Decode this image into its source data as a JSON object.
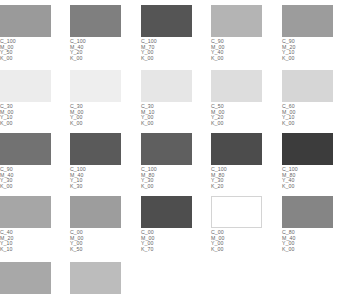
{
  "swatches": [
    {
      "color": "#9a9a9a",
      "label": [
        "C_100",
        "M_00",
        "Y_50",
        "K_00"
      ]
    },
    {
      "color": "#7f7f7f",
      "label": [
        "C_100",
        "M_40",
        "Y_20",
        "K_00"
      ]
    },
    {
      "color": "#555555",
      "label": [
        "C_100",
        "M_70",
        "Y_00",
        "K_00"
      ]
    },
    {
      "color": "#b4b4b4",
      "label": [
        "C_90",
        "M_00",
        "Y_40",
        "K_00"
      ]
    },
    {
      "color": "#9c9c9c",
      "label": [
        "C_90",
        "M_20",
        "Y_10",
        "K_00"
      ]
    },
    {
      "color": "#ececec",
      "label": [
        "C_30",
        "M_00",
        "Y_10",
        "K_00"
      ]
    },
    {
      "color": "#eeeeee",
      "label": [
        "C_30",
        "M_00",
        "Y_00",
        "K_00"
      ]
    },
    {
      "color": "#e6e6e6",
      "label": [
        "C_30",
        "M_10",
        "Y_00",
        "K_00"
      ]
    },
    {
      "color": "#dddddd",
      "label": [
        "C_50",
        "M_00",
        "Y_20",
        "K_00"
      ]
    },
    {
      "color": "#d6d6d6",
      "label": [
        "C_60",
        "M_00",
        "Y_10",
        "K_00"
      ]
    },
    {
      "color": "#727272",
      "label": [
        "C_90",
        "M_40",
        "Y_30",
        "K_00"
      ]
    },
    {
      "color": "#5a5a5a",
      "label": [
        "C_100",
        "M_40",
        "Y_10",
        "K_30"
      ]
    },
    {
      "color": "#5f5f5f",
      "label": [
        "C_100",
        "M_80",
        "Y_30",
        "K_00"
      ]
    },
    {
      "color": "#4c4c4c",
      "label": [
        "C_100",
        "M_80",
        "Y_30",
        "K_20"
      ]
    },
    {
      "color": "#3c3c3c",
      "label": [
        "C_100",
        "M_80",
        "Y_40",
        "K_00"
      ]
    },
    {
      "color": "#a6a6a6",
      "label": [
        "C_40",
        "M_20",
        "Y_10",
        "K_10"
      ]
    },
    {
      "color": "#9d9d9d",
      "label": [
        "C_00",
        "M_00",
        "Y_00",
        "K_50"
      ]
    },
    {
      "color": "#4e4e4e",
      "label": [
        "C_00",
        "M_00",
        "Y_00",
        "K_70"
      ]
    },
    {
      "color": "#ffffff",
      "outlined": true,
      "label": [
        "C_00",
        "M_00",
        "Y_00",
        "K_00"
      ]
    },
    {
      "color": "#858585",
      "label": [
        "C_80",
        "M_40",
        "Y_00",
        "K_00"
      ]
    },
    {
      "color": "#a8a8a8",
      "label": []
    },
    {
      "color": "#bcbcbc",
      "label": []
    }
  ]
}
